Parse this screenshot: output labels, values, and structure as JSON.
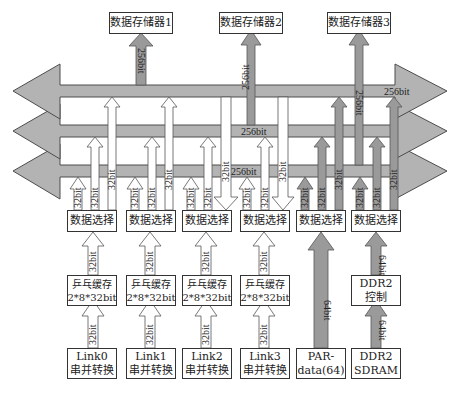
{
  "memories": [
    {
      "label": "数据存储器1",
      "bus_width": "256bit"
    },
    {
      "label": "数据存储器2",
      "bus_width": "256bit"
    },
    {
      "label": "数据存储器3",
      "bus_width": "256bit"
    }
  ],
  "buses": [
    {
      "name": "bus-1",
      "direction": "both",
      "label": "256bit"
    },
    {
      "name": "bus-2",
      "direction": "both",
      "label": "256bit"
    },
    {
      "name": "bus-3",
      "direction": "both",
      "label": "256bit"
    }
  ],
  "selectors": [
    {
      "label": "数据选择",
      "links": [
        "32bit",
        "32bit",
        "32bit"
      ]
    },
    {
      "label": "数据选择",
      "links": [
        "32bit",
        "32bit",
        "32bit"
      ]
    },
    {
      "label": "数据选择",
      "links": [
        "32bit",
        "32bit",
        "32bit"
      ]
    },
    {
      "label": "数据选择",
      "links": [
        "32bit",
        "32bit",
        "32bit"
      ]
    },
    {
      "label": "数据选择",
      "links": [
        "32bit",
        "32bit",
        "32bit"
      ]
    },
    {
      "label": "数据选择",
      "links": [
        "32bit",
        "32bit",
        "32bit"
      ]
    }
  ],
  "buffers": [
    {
      "line1": "乒乓缓存",
      "line2": "2*8*32bit",
      "in_width": "32bit",
      "out_width": "32bit"
    },
    {
      "line1": "乒乓缓存",
      "line2": "2*8*32bit",
      "in_width": "32bit",
      "out_width": "32bit"
    },
    {
      "line1": "乒乓缓存",
      "line2": "2*8*32bit",
      "in_width": "32bit",
      "out_width": "32bit"
    },
    {
      "line1": "乒乓缓存",
      "line2": "2*8*32bit",
      "in_width": "32bit",
      "out_width": "32bit"
    }
  ],
  "ddr_controller": {
    "line1": "DDR2",
    "line2": "控制",
    "in_width": "64bit",
    "out_width": "64bit"
  },
  "sources": [
    {
      "line1": "Link0",
      "line2": "串并转换"
    },
    {
      "line1": "Link1",
      "line2": "串并转换"
    },
    {
      "line1": "Link2",
      "line2": "串并转换"
    },
    {
      "line1": "Link3",
      "line2": "串并转换"
    },
    {
      "line1": "PAR-",
      "line2": "data(64)",
      "out_width": "64bit"
    },
    {
      "line1": "DDR2",
      "line2": "SDRAM"
    }
  ],
  "colors": {
    "bus_fill": "#b3b3b3",
    "bus_stroke": "#4d4d4d",
    "gray_arrow": "#999999",
    "white_arrow": "#ffffff",
    "box_border": "#333333"
  }
}
